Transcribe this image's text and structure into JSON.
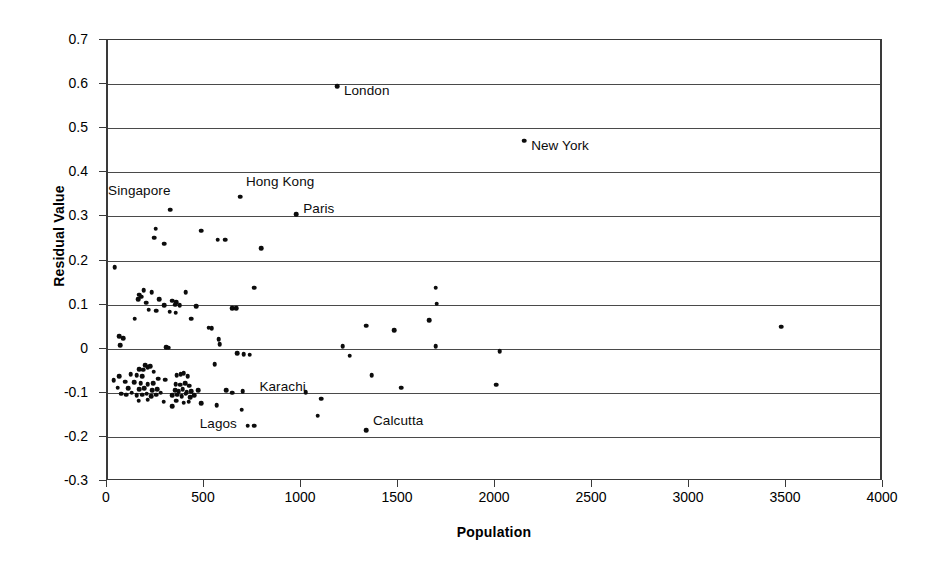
{
  "chart_data": {
    "type": "scatter",
    "title": "",
    "xlabel": "Population",
    "ylabel": "Residual Value",
    "xlim": [
      0,
      4000
    ],
    "ylim": [
      -0.3,
      0.7
    ],
    "grid": true,
    "legend": "none",
    "xticks": [
      0,
      500,
      1000,
      1500,
      2000,
      2500,
      3000,
      3500,
      4000
    ],
    "xtick_labels": [
      "0",
      "500",
      "1000",
      "1500",
      "2000",
      "2500",
      "3000",
      "3500",
      "4000"
    ],
    "yticks": [
      -0.3,
      -0.2,
      -0.1,
      0,
      0.1,
      0.2,
      0.3,
      0.4,
      0.5,
      0.6,
      0.7
    ],
    "ytick_labels": [
      "-0.3",
      "-0.2",
      "-0.1",
      "0",
      "0.1",
      "0.2",
      "0.3",
      "0.4",
      "0.5",
      "0.6",
      "0.7"
    ],
    "marker_color": "#0c0c0c",
    "annotations": [
      {
        "label": "London",
        "x": 1180,
        "y": 0.595,
        "dx": 7,
        "dy": 11
      },
      {
        "label": "New York",
        "x": 2145,
        "y": 0.472,
        "dx": 7,
        "dy": 11
      },
      {
        "label": "Singapore",
        "x": 320,
        "y": 0.315,
        "dx": -62,
        "dy": -13
      },
      {
        "label": "Hong Kong",
        "x": 680,
        "y": 0.345,
        "dx": 6,
        "dy": -9
      },
      {
        "label": "Paris",
        "x": 970,
        "y": 0.305,
        "dx": 7,
        "dy": 1
      },
      {
        "label": "Karachi",
        "x": 1100,
        "y": -0.113,
        "dx": -62,
        "dy": -6
      },
      {
        "label": "Lagos",
        "x": 720,
        "y": -0.175,
        "dx": -48,
        "dy": 4
      },
      {
        "label": "Calcutta",
        "x": 1330,
        "y": -0.185,
        "dx": 7,
        "dy": -3
      }
    ],
    "points": [
      {
        "x": 1180,
        "y": 0.595
      },
      {
        "x": 2145,
        "y": 0.472
      },
      {
        "x": 680,
        "y": 0.345
      },
      {
        "x": 320,
        "y": 0.315
      },
      {
        "x": 970,
        "y": 0.305
      },
      {
        "x": 245,
        "y": 0.272
      },
      {
        "x": 480,
        "y": 0.268
      },
      {
        "x": 238,
        "y": 0.252
      },
      {
        "x": 565,
        "y": 0.247
      },
      {
        "x": 605,
        "y": 0.247
      },
      {
        "x": 290,
        "y": 0.238
      },
      {
        "x": 790,
        "y": 0.228
      },
      {
        "x": 35,
        "y": 0.185
      },
      {
        "x": 1690,
        "y": 0.138
      },
      {
        "x": 755,
        "y": 0.138
      },
      {
        "x": 185,
        "y": 0.132
      },
      {
        "x": 225,
        "y": 0.128
      },
      {
        "x": 400,
        "y": 0.128
      },
      {
        "x": 160,
        "y": 0.122
      },
      {
        "x": 172,
        "y": 0.118
      },
      {
        "x": 155,
        "y": 0.112
      },
      {
        "x": 265,
        "y": 0.112
      },
      {
        "x": 330,
        "y": 0.109
      },
      {
        "x": 352,
        "y": 0.106
      },
      {
        "x": 197,
        "y": 0.104
      },
      {
        "x": 1695,
        "y": 0.102
      },
      {
        "x": 345,
        "y": 0.1
      },
      {
        "x": 290,
        "y": 0.098
      },
      {
        "x": 370,
        "y": 0.098
      },
      {
        "x": 455,
        "y": 0.096
      },
      {
        "x": 640,
        "y": 0.092
      },
      {
        "x": 660,
        "y": 0.092
      },
      {
        "x": 210,
        "y": 0.088
      },
      {
        "x": 248,
        "y": 0.086
      },
      {
        "x": 318,
        "y": 0.084
      },
      {
        "x": 350,
        "y": 0.082
      },
      {
        "x": 138,
        "y": 0.068
      },
      {
        "x": 430,
        "y": 0.068
      },
      {
        "x": 1655,
        "y": 0.065
      },
      {
        "x": 1330,
        "y": 0.052
      },
      {
        "x": 3470,
        "y": 0.05
      },
      {
        "x": 520,
        "y": 0.048
      },
      {
        "x": 535,
        "y": 0.046
      },
      {
        "x": 1475,
        "y": 0.042
      },
      {
        "x": 58,
        "y": 0.028
      },
      {
        "x": 78,
        "y": 0.024
      },
      {
        "x": 570,
        "y": 0.022
      },
      {
        "x": 575,
        "y": 0.01
      },
      {
        "x": 62,
        "y": 0.008
      },
      {
        "x": 1210,
        "y": 0.006
      },
      {
        "x": 1690,
        "y": 0.006
      },
      {
        "x": 300,
        "y": 0.004
      },
      {
        "x": 312,
        "y": 0.002
      },
      {
        "x": 2020,
        "y": -0.006
      },
      {
        "x": 665,
        "y": -0.01
      },
      {
        "x": 700,
        "y": -0.012
      },
      {
        "x": 730,
        "y": -0.014
      },
      {
        "x": 1245,
        "y": -0.016
      },
      {
        "x": 550,
        "y": -0.035
      },
      {
        "x": 192,
        "y": -0.038
      },
      {
        "x": 205,
        "y": -0.042
      },
      {
        "x": 218,
        "y": -0.04
      },
      {
        "x": 162,
        "y": -0.046
      },
      {
        "x": 182,
        "y": -0.048
      },
      {
        "x": 235,
        "y": -0.052
      },
      {
        "x": 1360,
        "y": -0.06
      },
      {
        "x": 58,
        "y": -0.062
      },
      {
        "x": 118,
        "y": -0.058
      },
      {
        "x": 148,
        "y": -0.06
      },
      {
        "x": 175,
        "y": -0.062
      },
      {
        "x": 355,
        "y": -0.06
      },
      {
        "x": 375,
        "y": -0.058
      },
      {
        "x": 390,
        "y": -0.055
      },
      {
        "x": 410,
        "y": -0.062
      },
      {
        "x": 260,
        "y": -0.068
      },
      {
        "x": 295,
        "y": -0.07
      },
      {
        "x": 30,
        "y": -0.072
      },
      {
        "x": 90,
        "y": -0.075
      },
      {
        "x": 135,
        "y": -0.076
      },
      {
        "x": 168,
        "y": -0.078
      },
      {
        "x": 205,
        "y": -0.08
      },
      {
        "x": 232,
        "y": -0.078
      },
      {
        "x": 350,
        "y": -0.08
      },
      {
        "x": 372,
        "y": -0.082
      },
      {
        "x": 398,
        "y": -0.078
      },
      {
        "x": 418,
        "y": -0.084
      },
      {
        "x": 2000,
        "y": -0.082
      },
      {
        "x": 1510,
        "y": -0.088
      },
      {
        "x": 50,
        "y": -0.088
      },
      {
        "x": 105,
        "y": -0.09
      },
      {
        "x": 160,
        "y": -0.092
      },
      {
        "x": 188,
        "y": -0.09
      },
      {
        "x": 228,
        "y": -0.094
      },
      {
        "x": 255,
        "y": -0.092
      },
      {
        "x": 345,
        "y": -0.094
      },
      {
        "x": 365,
        "y": -0.096
      },
      {
        "x": 385,
        "y": -0.092
      },
      {
        "x": 405,
        "y": -0.098
      },
      {
        "x": 430,
        "y": -0.096
      },
      {
        "x": 465,
        "y": -0.094
      },
      {
        "x": 608,
        "y": -0.094
      },
      {
        "x": 640,
        "y": -0.1
      },
      {
        "x": 695,
        "y": -0.096
      },
      {
        "x": 1020,
        "y": -0.098
      },
      {
        "x": 68,
        "y": -0.102
      },
      {
        "x": 95,
        "y": -0.104
      },
      {
        "x": 122,
        "y": -0.1
      },
      {
        "x": 148,
        "y": -0.106
      },
      {
        "x": 175,
        "y": -0.104
      },
      {
        "x": 200,
        "y": -0.102
      },
      {
        "x": 222,
        "y": -0.108
      },
      {
        "x": 248,
        "y": -0.104
      },
      {
        "x": 272,
        "y": -0.1
      },
      {
        "x": 330,
        "y": -0.106
      },
      {
        "x": 358,
        "y": -0.104
      },
      {
        "x": 380,
        "y": -0.108
      },
      {
        "x": 400,
        "y": -0.102
      },
      {
        "x": 425,
        "y": -0.11
      },
      {
        "x": 445,
        "y": -0.106
      },
      {
        "x": 1100,
        "y": -0.113
      },
      {
        "x": 158,
        "y": -0.118
      },
      {
        "x": 205,
        "y": -0.116
      },
      {
        "x": 288,
        "y": -0.12
      },
      {
        "x": 352,
        "y": -0.118
      },
      {
        "x": 390,
        "y": -0.122
      },
      {
        "x": 415,
        "y": -0.12
      },
      {
        "x": 480,
        "y": -0.124
      },
      {
        "x": 560,
        "y": -0.128
      },
      {
        "x": 330,
        "y": -0.13
      },
      {
        "x": 690,
        "y": -0.138
      },
      {
        "x": 1080,
        "y": -0.152
      },
      {
        "x": 755,
        "y": -0.175
      },
      {
        "x": 720,
        "y": -0.175
      },
      {
        "x": 1330,
        "y": -0.185
      }
    ]
  }
}
